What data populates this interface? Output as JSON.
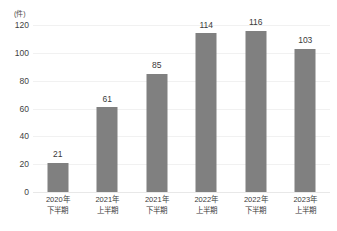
{
  "chart_data": {
    "type": "bar",
    "title": "",
    "subtitle": "",
    "xlabel": "",
    "ylabel": "(件)",
    "unit_label": "(件)",
    "categories": [
      "2020年 下半期",
      "2021年 上半期",
      "2021年 下半期",
      "2022年 上半期",
      "2022年 下半期",
      "2023年 上半期"
    ],
    "category_lines": [
      [
        "2020年",
        "下半期"
      ],
      [
        "2021年",
        "上半期"
      ],
      [
        "2021年",
        "下半期"
      ],
      [
        "2022年",
        "上半期"
      ],
      [
        "2022年",
        "下半期"
      ],
      [
        "2023年",
        "上半期"
      ]
    ],
    "values": [
      21,
      61,
      85,
      114,
      116,
      103
    ],
    "value_labels": [
      "21",
      "61",
      "85",
      "114",
      "116",
      "103"
    ],
    "ylim": [
      0,
      120
    ],
    "yticks": [
      0,
      20,
      40,
      60,
      80,
      100,
      120
    ],
    "ytick_labels": [
      "0",
      "20",
      "40",
      "60",
      "80",
      "100",
      "120"
    ],
    "grid": true,
    "legend": false,
    "legend_position": "none",
    "bar_color": "#808080",
    "grid_color": "#f1f1f1",
    "background_color": "#ffffff",
    "text_color": "#3a3a3a"
  }
}
